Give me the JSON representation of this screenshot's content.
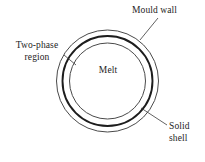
{
  "figure": {
    "type": "annotated-cross-section-diagram",
    "background_color": "#ffffff",
    "line_color": "#1d1d1d"
  },
  "geometry": {
    "center": {
      "x": 107.5,
      "y": 81
    },
    "circles": [
      {
        "name": "mould-wall-circle",
        "radius": 51,
        "stroke_width": 1,
        "color": "#4a4a4a"
      },
      {
        "name": "solid-shell-circle",
        "radius": 45,
        "stroke_width": 1.9,
        "color": "#1d1d1d"
      },
      {
        "name": "two-phase-boundary-circle",
        "radius": 38,
        "stroke_width": 1,
        "color": "#4a4a4a"
      }
    ]
  },
  "labels": {
    "mould_wall": {
      "text": "Mould wall",
      "leader": {
        "x1": 158,
        "y1": 18,
        "x2": 140,
        "y2": 40
      }
    },
    "two_phase": {
      "line1": "Two-phase",
      "line2": "region",
      "leader": {
        "x1": 64,
        "y1": 55,
        "x2": 76,
        "y2": 65
      }
    },
    "solid_shell": {
      "line1": "Solid",
      "line2": "shell",
      "leader": {
        "x1": 167,
        "y1": 125,
        "x2": 141,
        "y2": 108
      }
    },
    "melt": {
      "text": "Melt"
    }
  }
}
